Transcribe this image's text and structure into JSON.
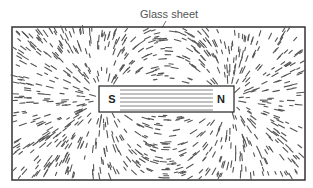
{
  "diagram": {
    "caption": "Glass sheet",
    "magnet": {
      "south_label": "S",
      "north_label": "N"
    },
    "colors": {
      "lines": "#555555",
      "frame": "#333333",
      "background": "#ffffff"
    }
  }
}
